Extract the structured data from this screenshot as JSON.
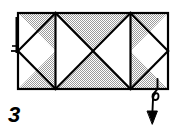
{
  "figure": {
    "step_label": "3",
    "colors": {
      "ink": "#000000",
      "paper_shaded": "#c9c9c9",
      "paper_white": "#ffffff",
      "background": "#ffffff"
    },
    "sheet": {
      "shape": "rectangle",
      "x": 18,
      "y": 13,
      "width": 150,
      "height": 76,
      "stroke_width": 2.2,
      "fill": "#c9c9c9",
      "pattern": "halftone-dots"
    },
    "creases": {
      "vertical": [
        {
          "name": "vertical-crease-left",
          "x": 55.5
        },
        {
          "name": "vertical-crease-right",
          "x": 130.5
        }
      ],
      "diagonals": [
        {
          "name": "diagonal-a",
          "x1": 18,
          "y1": 51,
          "x2": 55.5,
          "y2": 13
        },
        {
          "name": "diagonal-b",
          "x1": 18,
          "y1": 51,
          "x2": 55.5,
          "y2": 89
        },
        {
          "name": "diagonal-c",
          "x1": 55.5,
          "y1": 13,
          "x2": 93,
          "y2": 51
        },
        {
          "name": "diagonal-d",
          "x1": 55.5,
          "y1": 89,
          "x2": 93,
          "y2": 51
        },
        {
          "name": "diagonal-e",
          "x1": 93,
          "y1": 51,
          "x2": 130.5,
          "y2": 13
        },
        {
          "name": "diagonal-f",
          "x1": 93,
          "y1": 51,
          "x2": 130.5,
          "y2": 89
        },
        {
          "name": "diagonal-g",
          "x1": 130.5,
          "y1": 13,
          "x2": 168,
          "y2": 51
        },
        {
          "name": "diagonal-h",
          "x1": 130.5,
          "y1": 89,
          "x2": 168,
          "y2": 51
        }
      ]
    },
    "white_panels": [
      {
        "name": "white-triangle-left",
        "points": "18,13 18,89 55.5,51"
      },
      {
        "name": "white-triangle-left-mid",
        "points": "55.5,13 55.5,89 93,51"
      },
      {
        "name": "white-triangle-right-mid",
        "points": "130.5,13 130.5,89 93,51"
      },
      {
        "name": "white-triangle-right",
        "points": "168,13 168,89 130.5,51"
      }
    ],
    "left_edge_marker": {
      "name": "left-edge-thick-fold",
      "x": 17,
      "y_top": 17,
      "y_bottom": 53,
      "tick_y": 51,
      "tick_length": 7,
      "stroke_width": 3.4
    },
    "fold_arrow": {
      "name": "fold-over-arrow",
      "description": "curved fold-over arrow at lower right indicating the right flap folds down and behind",
      "path": "M 157,82 C 156,88 151,90 151,96 C 151,101 157,101 157,96 C 157,90 152,92 152,100 L 152,118",
      "start_tail": "M 157,80 L 157,86",
      "head_points": "147,113 157,113 152,124",
      "stroke_width": 2.0
    }
  }
}
